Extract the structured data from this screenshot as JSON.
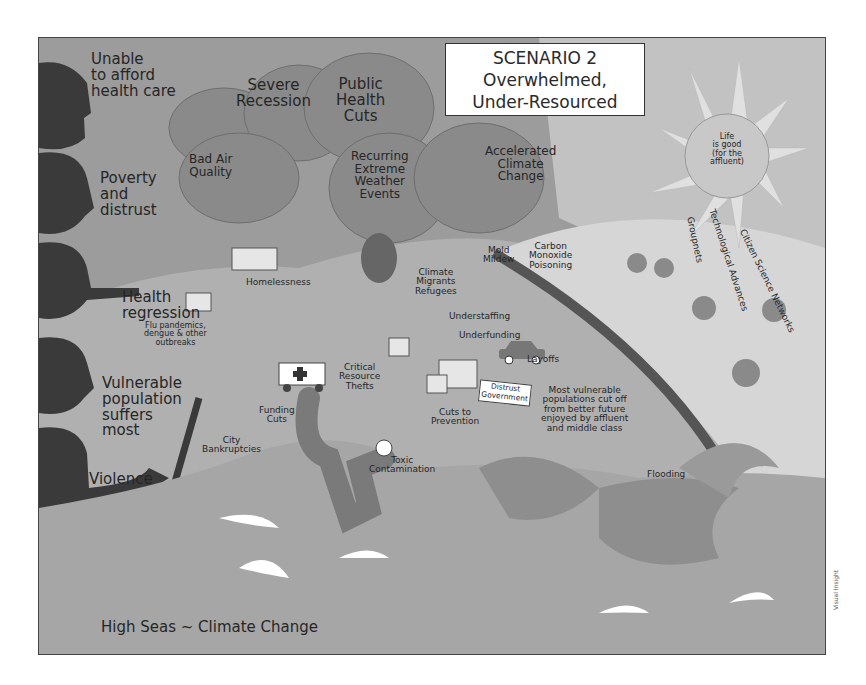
{
  "title": {
    "line1": "SCENARIO 2",
    "line2": "Overwhelmed,",
    "line3": "Under-Resourced"
  },
  "sun": {
    "line1": "Life",
    "line2": "is good",
    "line3": "(for the",
    "line4": "affluent)"
  },
  "left_figures": {
    "unable": [
      "Unable",
      "to afford",
      "health care"
    ],
    "poverty": [
      "Poverty",
      "and",
      "distrust"
    ],
    "health": [
      "Health",
      "regression"
    ],
    "outbreaks": [
      "Flu pandemics,",
      "dengue & other",
      "outbreaks"
    ],
    "vulnerable": [
      "Vulnerable",
      "population",
      "suffers",
      "most"
    ],
    "violence": "Violence"
  },
  "clouds": {
    "recession": [
      "Severe",
      "Recession"
    ],
    "public_health": [
      "Public",
      "Health",
      "Cuts"
    ],
    "bad_air": [
      "Bad Air",
      "Quality"
    ],
    "weather": [
      "Recurring",
      "Extreme",
      "Weather",
      "Events"
    ],
    "climate": [
      "Accelerated",
      "Climate",
      "Change"
    ]
  },
  "landscape": {
    "mold": [
      "Mold",
      "Mildew"
    ],
    "carbon": [
      "Carbon",
      "Monoxide",
      "Poisoning"
    ],
    "migrants": [
      "Climate",
      "Migrants",
      "Refugees"
    ],
    "homelessness": "Homelessness",
    "understaffing": "Understaffing",
    "underfunding": "Underfunding",
    "layoffs": "Layoffs",
    "critical": [
      "Critical",
      "Resource",
      "Thefts"
    ],
    "cuts_prevention": [
      "Cuts to",
      "Prevention"
    ],
    "distrust_sign": [
      "Distrust",
      "Government"
    ],
    "funding_cuts": [
      "Funding",
      "Cuts"
    ],
    "city": [
      "City",
      "Bankruptcies"
    ],
    "toxic": [
      "Toxic",
      "Contamination"
    ],
    "most_vulnerable": [
      "Most vulnerable",
      "populations cut off",
      "from better future",
      "enjoyed by affluent",
      "and middle class"
    ],
    "flooding": "Flooding",
    "high_seas": "High Seas ~ Climate Change"
  },
  "sun_rays": {
    "grouponets": "Groupnets",
    "tech": "Technological Advances",
    "citizen": "Citizen Science Networks"
  },
  "credit": "Visual Insight",
  "colors": {
    "sky": "#9c9c9c",
    "cloud": "#8a8a8a",
    "land": "#b4b4b4",
    "affluent_land": "#d2d2d2",
    "sea": "#a6a6a6",
    "silhouette": "#3a3a3a",
    "wall": "#6a6a6a"
  }
}
